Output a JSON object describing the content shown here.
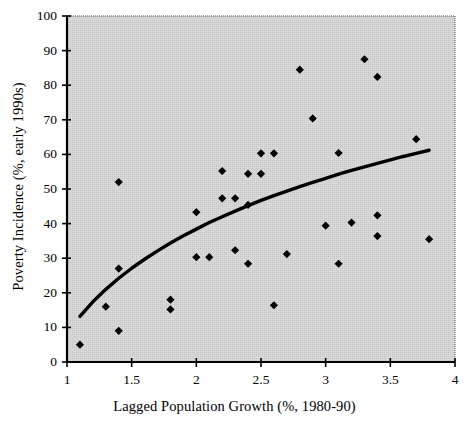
{
  "chart_data": {
    "type": "scatter",
    "title": "",
    "xlabel": "Lagged Population Growth (%, 1980-90)",
    "ylabel": "Poverty Incidence (%, early 1990s)",
    "xlim": [
      1,
      4
    ],
    "ylim": [
      0,
      100
    ],
    "xticks": [
      1,
      1.5,
      2,
      2.5,
      3,
      3.5,
      4
    ],
    "xtick_labels": [
      "1",
      "1.5",
      "2",
      "2.5",
      "3",
      "3.5",
      "4"
    ],
    "yticks": [
      0,
      10,
      20,
      30,
      40,
      50,
      60,
      70,
      80,
      90,
      100
    ],
    "ytick_labels": [
      "0",
      "10",
      "20",
      "30",
      "40",
      "50",
      "60",
      "70",
      "80",
      "90",
      "100"
    ],
    "grid": false,
    "legend": "none",
    "plot_background": "#d8d8d8",
    "marker_color": "#000000",
    "marker_shape": "diamond",
    "trendline_color": "#000000",
    "trendline_type": "logarithmic",
    "series": [
      {
        "name": "Countries",
        "points": [
          [
            1.1,
            5.0
          ],
          [
            1.3,
            16.0
          ],
          [
            1.4,
            52.0
          ],
          [
            1.4,
            27.0
          ],
          [
            1.4,
            9.0
          ],
          [
            1.8,
            18.0
          ],
          [
            1.8,
            15.2
          ],
          [
            2.0,
            43.3
          ],
          [
            2.0,
            30.3
          ],
          [
            2.1,
            30.3
          ],
          [
            2.2,
            55.2
          ],
          [
            2.2,
            47.3
          ],
          [
            2.3,
            47.3
          ],
          [
            2.3,
            32.3
          ],
          [
            2.4,
            54.4
          ],
          [
            2.4,
            45.4
          ],
          [
            2.4,
            28.4
          ],
          [
            2.5,
            60.3
          ],
          [
            2.5,
            54.4
          ],
          [
            2.6,
            60.3
          ],
          [
            2.6,
            16.4
          ],
          [
            2.7,
            31.2
          ],
          [
            2.8,
            84.5
          ],
          [
            2.9,
            70.4
          ],
          [
            3.0,
            39.4
          ],
          [
            3.1,
            60.4
          ],
          [
            3.1,
            28.4
          ],
          [
            3.2,
            40.3
          ],
          [
            3.3,
            87.5
          ],
          [
            3.4,
            82.4
          ],
          [
            3.4,
            42.4
          ],
          [
            3.4,
            36.4
          ],
          [
            3.7,
            64.4
          ],
          [
            3.8,
            35.5
          ]
        ]
      }
    ],
    "trendline": {
      "name": "Fitted logarithmic curve",
      "points": [
        [
          1.1,
          13.2
        ],
        [
          1.2,
          17.4
        ],
        [
          1.3,
          21.0
        ],
        [
          1.4,
          24.2
        ],
        [
          1.5,
          27.1
        ],
        [
          1.6,
          29.7
        ],
        [
          1.7,
          32.1
        ],
        [
          1.8,
          34.4
        ],
        [
          1.9,
          36.5
        ],
        [
          2.0,
          38.4
        ],
        [
          2.1,
          40.3
        ],
        [
          2.2,
          42.0
        ],
        [
          2.3,
          43.6
        ],
        [
          2.4,
          45.2
        ],
        [
          2.5,
          46.7
        ],
        [
          2.6,
          48.1
        ],
        [
          2.7,
          49.4
        ],
        [
          2.8,
          50.7
        ],
        [
          2.9,
          51.9
        ],
        [
          3.0,
          53.1
        ],
        [
          3.1,
          54.3
        ],
        [
          3.2,
          55.4
        ],
        [
          3.3,
          56.4
        ],
        [
          3.4,
          57.4
        ],
        [
          3.5,
          58.4
        ],
        [
          3.6,
          59.4
        ],
        [
          3.7,
          60.3
        ],
        [
          3.8,
          61.2
        ]
      ]
    }
  }
}
